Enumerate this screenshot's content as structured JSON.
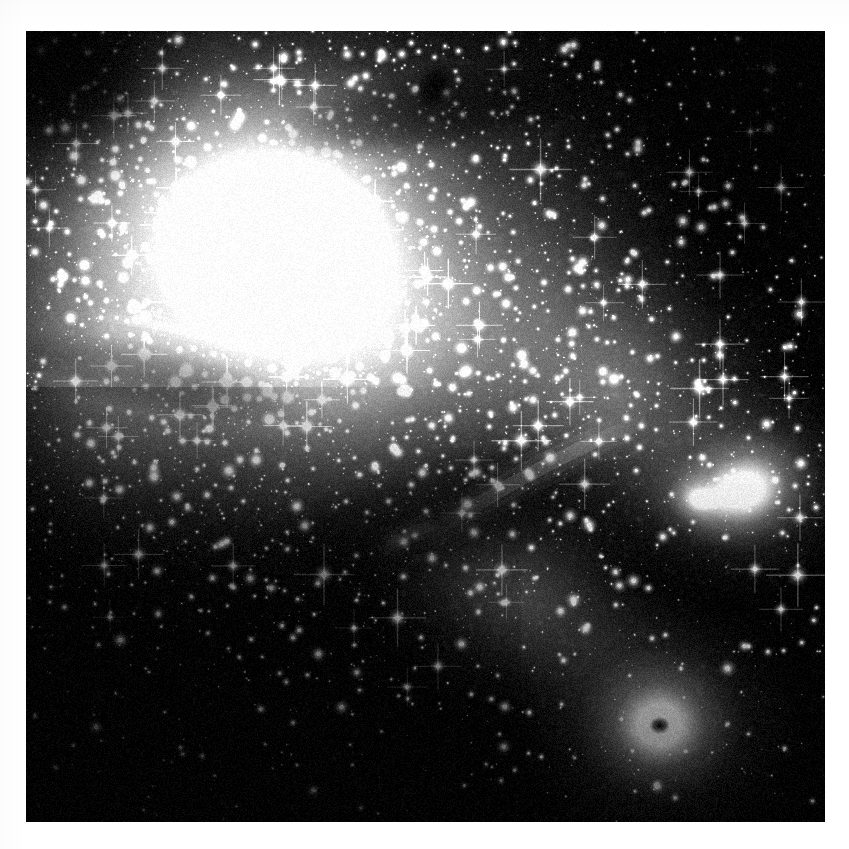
{
  "image": {
    "kind": "astronomical-photograph",
    "title": "Star cluster and emission nebula complex",
    "medium": "monochrome photographic plate",
    "canvas": {
      "width": 849,
      "height": 849,
      "background": "#ffffff"
    },
    "plate": {
      "x": 26,
      "y": 31,
      "width": 799,
      "height": 791,
      "background": "#000000"
    },
    "palette": {
      "sky_black": "#000000",
      "faint_nebula": "#3a3a3a",
      "mid_nebula": "#8c8c8c",
      "bright_nebula": "#d8d8d8",
      "core_white": "#ffffff",
      "dark_lane": "#121212",
      "paper_white": "#ffffff"
    },
    "notes": "No text, caption, axis or legend is present in the frame."
  },
  "scene": {
    "nebulosity": [
      {
        "name": "main-diffuse-glow",
        "cx": 0.33,
        "cy": 0.3,
        "rx": 0.52,
        "ry": 0.44,
        "intensity": 0.72,
        "rotation": -18
      },
      {
        "name": "upper-left-wash",
        "cx": 0.22,
        "cy": 0.22,
        "rx": 0.34,
        "ry": 0.28,
        "intensity": 0.6,
        "rotation": -10
      },
      {
        "name": "central-band",
        "cx": 0.45,
        "cy": 0.4,
        "rx": 0.46,
        "ry": 0.26,
        "intensity": 0.55,
        "rotation": -22
      },
      {
        "name": "right-arm",
        "cx": 0.74,
        "cy": 0.46,
        "rx": 0.26,
        "ry": 0.22,
        "intensity": 0.5,
        "rotation": 20
      },
      {
        "name": "lower-bridge",
        "cx": 0.62,
        "cy": 0.72,
        "rx": 0.26,
        "ry": 0.16,
        "intensity": 0.4,
        "rotation": 28
      },
      {
        "name": "left-flank",
        "cx": 0.1,
        "cy": 0.42,
        "rx": 0.22,
        "ry": 0.28,
        "intensity": 0.44,
        "rotation": 0
      }
    ],
    "cluster": {
      "name": "central-star-cluster",
      "cx": 0.325,
      "cy": 0.272,
      "core_radius": 0.055,
      "halo_radius": 0.17,
      "peak_brightness": 1.0,
      "member_count": 520
    },
    "bright_knots": [
      {
        "name": "right-nebula-knot",
        "cx": 0.9,
        "cy": 0.58,
        "rx": 0.085,
        "ry": 0.07,
        "intensity": 0.96,
        "rotation": -15
      },
      {
        "name": "lower-round-nebula",
        "cx": 0.793,
        "cy": 0.878,
        "rx": 0.092,
        "ry": 0.086,
        "intensity": 1.0,
        "rotation": 0
      },
      {
        "name": "knot-spur-west",
        "cx": 0.845,
        "cy": 0.592,
        "rx": 0.04,
        "ry": 0.03,
        "intensity": 0.7,
        "rotation": 10
      }
    ],
    "dark_features": [
      {
        "name": "dark-globule-top",
        "cx": 0.512,
        "cy": 0.07,
        "rx": 0.022,
        "ry": 0.03,
        "opacity": 0.92,
        "rotation": 20
      },
      {
        "name": "dark-globule-in-blob",
        "cx": 0.793,
        "cy": 0.878,
        "rx": 0.013,
        "ry": 0.011,
        "opacity": 0.95,
        "rotation": 0
      },
      {
        "name": "dark-lane-upper",
        "cx": 0.52,
        "cy": 0.1,
        "rx": 0.22,
        "ry": 0.055,
        "opacity": 0.55,
        "rotation": -8
      },
      {
        "name": "dark-lane-left",
        "cx": 0.16,
        "cy": 0.44,
        "rx": 0.2,
        "ry": 0.045,
        "opacity": 0.4,
        "rotation": 12
      },
      {
        "name": "dark-lane-centre",
        "cx": 0.5,
        "cy": 0.62,
        "rx": 0.28,
        "ry": 0.08,
        "opacity": 0.45,
        "rotation": -16
      },
      {
        "name": "dark-corner-topleft",
        "cx": 0.045,
        "cy": 0.055,
        "rx": 0.12,
        "ry": 0.1,
        "opacity": 0.85,
        "rotation": 0
      },
      {
        "name": "dark-corner-topright",
        "cx": 0.96,
        "cy": 0.07,
        "rx": 0.12,
        "ry": 0.12,
        "opacity": 0.8,
        "rotation": 0
      }
    ],
    "filaments": [
      {
        "name": "diagonal-bright-ridge",
        "x1": 0.5,
        "y1": 0.64,
        "x2": 0.78,
        "y2": 0.49,
        "width": 0.01,
        "intensity": 0.8
      },
      {
        "name": "ridge-extension",
        "x1": 0.44,
        "y1": 0.665,
        "x2": 0.52,
        "y2": 0.625,
        "width": 0.008,
        "intensity": 0.62
      },
      {
        "name": "faint-streamer-left",
        "x1": 0.06,
        "y1": 0.36,
        "x2": 0.3,
        "y2": 0.41,
        "width": 0.007,
        "intensity": 0.35
      }
    ],
    "bright_stars": [
      {
        "x": 0.193,
        "y": 0.343,
        "mag": 1.0,
        "spikes": true
      },
      {
        "x": 0.644,
        "y": 0.175,
        "mag": 0.92,
        "spikes": true
      },
      {
        "x": 0.966,
        "y": 0.688,
        "mag": 0.95,
        "spikes": true
      },
      {
        "x": 0.373,
        "y": 0.687,
        "mag": 0.9,
        "spikes": true
      },
      {
        "x": 0.843,
        "y": 0.452,
        "mag": 0.84,
        "spikes": true
      },
      {
        "x": 0.62,
        "y": 0.518,
        "mag": 0.86,
        "spikes": true
      },
      {
        "x": 0.551,
        "y": 0.43,
        "mag": 0.8,
        "spikes": false
      },
      {
        "x": 0.736,
        "y": 0.44,
        "mag": 0.78,
        "spikes": false
      },
      {
        "x": 0.303,
        "y": 0.363,
        "mag": 0.76,
        "spikes": false
      },
      {
        "x": 0.465,
        "y": 0.742,
        "mag": 0.82,
        "spikes": true
      },
      {
        "x": 0.118,
        "y": 0.77,
        "mag": 0.74,
        "spikes": false
      },
      {
        "x": 0.878,
        "y": 0.806,
        "mag": 0.72,
        "spikes": false
      },
      {
        "x": 0.968,
        "y": 0.358,
        "mag": 0.7,
        "spikes": false
      },
      {
        "x": 0.254,
        "y": 0.556,
        "mag": 0.72,
        "spikes": false
      },
      {
        "x": 0.705,
        "y": 0.625,
        "mag": 0.7,
        "spikes": false
      },
      {
        "x": 0.395,
        "y": 0.855,
        "mag": 0.66,
        "spikes": false
      },
      {
        "x": 0.073,
        "y": 0.296,
        "mag": 0.68,
        "spikes": false
      },
      {
        "x": 0.598,
        "y": 0.905,
        "mag": 0.64,
        "spikes": false
      },
      {
        "x": 0.845,
        "y": 0.248,
        "mag": 0.66,
        "spikes": false
      },
      {
        "x": 0.47,
        "y": 0.172,
        "mag": 0.68,
        "spikes": false
      },
      {
        "x": 0.262,
        "y": 0.118,
        "mag": 0.64,
        "spikes": false
      },
      {
        "x": 0.93,
        "y": 0.122,
        "mag": 0.62,
        "spikes": false
      },
      {
        "x": 0.155,
        "y": 0.628,
        "mag": 0.6,
        "spikes": false
      },
      {
        "x": 0.545,
        "y": 0.775,
        "mag": 0.62,
        "spikes": false
      },
      {
        "x": 0.69,
        "y": 0.3,
        "mag": 0.66,
        "spikes": false
      },
      {
        "x": 0.088,
        "y": 0.88,
        "mag": 0.58,
        "spikes": false
      },
      {
        "x": 0.36,
        "y": 0.96,
        "mag": 0.56,
        "spikes": false
      },
      {
        "x": 0.79,
        "y": 0.955,
        "mag": 0.58,
        "spikes": false
      }
    ],
    "star_field": {
      "dense_count": 4200,
      "sparse_count": 900,
      "seed": 20240517
    }
  }
}
